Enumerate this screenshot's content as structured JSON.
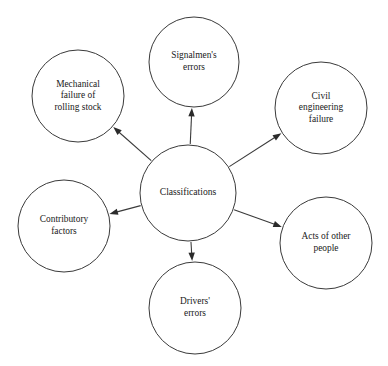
{
  "diagram": {
    "type": "radial-spoke",
    "title": "Classifications",
    "center": {
      "id": "classifications",
      "label": "Classifications",
      "lines": [
        "Classifications"
      ],
      "cx": 188,
      "cy": 193,
      "r": 48
    },
    "nodes": [
      {
        "id": "signalmens-errors",
        "label": "Signalmen's errors",
        "lines": [
          "Signalmen's",
          "errors"
        ],
        "cx": 194,
        "cy": 62,
        "r": 45,
        "direction": "top"
      },
      {
        "id": "civil-engineering-failure",
        "label": "Civil engineering failure",
        "lines": [
          "Civil",
          "engineering",
          "failure"
        ],
        "cx": 321,
        "cy": 108,
        "r": 46,
        "direction": "top-right"
      },
      {
        "id": "acts-of-other-people",
        "label": "Acts of other people",
        "lines": [
          "Acts of other",
          "people"
        ],
        "cx": 326,
        "cy": 243,
        "r": 46,
        "direction": "bottom-right"
      },
      {
        "id": "drivers-errors",
        "label": "Drivers' errors",
        "lines": [
          "Drivers'",
          "errors"
        ],
        "cx": 195,
        "cy": 308,
        "r": 46,
        "direction": "bottom"
      },
      {
        "id": "contributory-factors",
        "label": "Contributory factors",
        "lines": [
          "Contributory",
          "factors"
        ],
        "cx": 64,
        "cy": 226,
        "r": 46,
        "direction": "bottom-left"
      },
      {
        "id": "mechanical-failure-of-rolling-stock",
        "label": "Mechanical failure of rolling stock",
        "lines": [
          "Mechanical",
          "failure of",
          "rolling stock"
        ],
        "cx": 78,
        "cy": 96,
        "r": 46,
        "direction": "top-left"
      }
    ],
    "connectors": [
      {
        "id": "to-signalmens-errors",
        "from": "classifications",
        "to": "signalmens-errors",
        "arrow": "to-target"
      },
      {
        "id": "to-civil-engineering-failure",
        "from": "classifications",
        "to": "civil-engineering-failure",
        "arrow": "to-target"
      },
      {
        "id": "to-acts-of-other-people",
        "from": "classifications",
        "to": "acts-of-other-people",
        "arrow": "to-target"
      },
      {
        "id": "to-drivers-errors",
        "from": "classifications",
        "to": "drivers-errors",
        "arrow": "to-target"
      },
      {
        "id": "to-contributory-factors",
        "from": "classifications",
        "to": "contributory-factors",
        "arrow": "to-target"
      },
      {
        "id": "to-mechanical-failure-of-rolling-stock",
        "from": "classifications",
        "to": "mechanical-failure-of-rolling-stock",
        "arrow": "to-target"
      }
    ],
    "style": {
      "background": "#ffffff",
      "stroke": "#3a3a3a",
      "arrow_fill": "#2b2b2b",
      "text": "#1a1a1a"
    }
  }
}
